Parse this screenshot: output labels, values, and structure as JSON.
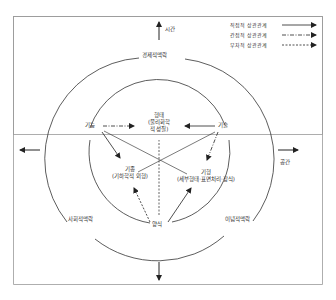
{
  "diagram": {
    "type": "concentric-relationship-diagram",
    "axes": {
      "up": "시간",
      "right": "공간",
      "left": "",
      "down": ""
    },
    "legend": [
      {
        "label": "직접적 상관관계",
        "line_style": "solid"
      },
      {
        "label": "간접적 상관관계",
        "line_style": "dash-dot"
      },
      {
        "label": "부차적 상관관계",
        "line_style": "dashed"
      }
    ],
    "outer_ring": {
      "top": "경제적맥락",
      "lower_left": "사회적맥락",
      "lower_right": "이념적맥락"
    },
    "center": {
      "title": "형태",
      "subtitle_line1": "(물리화학",
      "subtitle_line2": "적 성질)"
    },
    "nodes": {
      "left": "기능",
      "right": "기술",
      "lower_left_title": "기종",
      "lower_left_sub": "(기하학적 외형)",
      "lower_right_title": "기형",
      "lower_right_sub": "(세부형태·표면처리·장식)",
      "bottom": "양식"
    },
    "edges": [
      {
        "from": "기능",
        "to": "형태",
        "style": "dash-dot"
      },
      {
        "from": "기술",
        "to": "형태",
        "style": "solid"
      },
      {
        "from": "기능",
        "to": "기종",
        "style": "solid"
      },
      {
        "from": "기능",
        "to": "기형",
        "style": "solid-line"
      },
      {
        "from": "기술",
        "to": "기종",
        "style": "solid-line"
      },
      {
        "from": "기술",
        "to": "기형",
        "style": "dash-dot"
      },
      {
        "from": "양식",
        "to": "기종",
        "style": "dashed"
      },
      {
        "from": "양식",
        "to": "기형",
        "style": "solid"
      },
      {
        "from": "양식",
        "to": "형태",
        "style": "dashed"
      }
    ]
  }
}
